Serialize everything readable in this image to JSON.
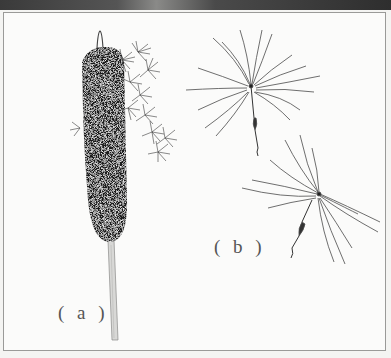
{
  "figure": {
    "panels": [
      {
        "id": "a",
        "label": "( a )",
        "subject": "cattail-spike-with-dispersing-seeds"
      },
      {
        "id": "b",
        "label": "( b )",
        "subject": "two-plumed-seeds"
      }
    ],
    "colors": {
      "ink": "#1e1e1e",
      "line": "#555555",
      "paper": "#fbfbfa",
      "frame": "#9a9a98",
      "top_strip": "#3a3a3a"
    }
  }
}
